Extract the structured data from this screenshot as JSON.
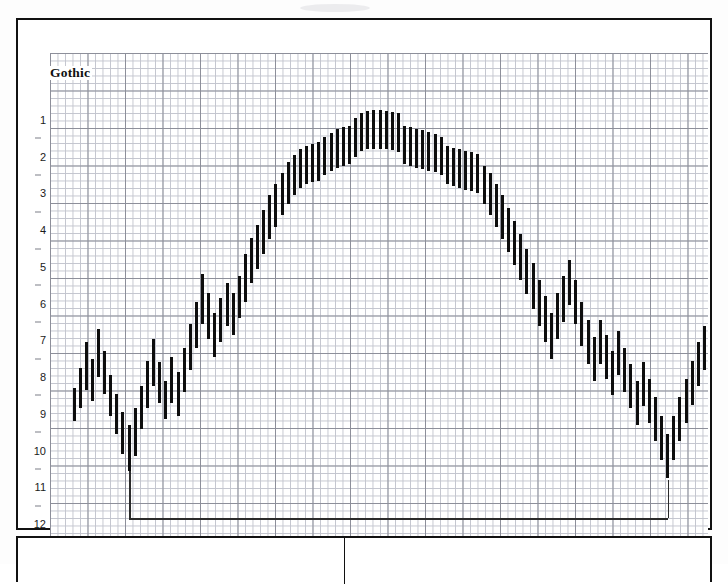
{
  "chart_data": {
    "type": "bar",
    "title": "Gothic",
    "subtitle": "",
    "xlabel": "",
    "ylabel": "",
    "grid": true,
    "legend_position": "none",
    "y_axis_inverted": true,
    "ylim": [
      0.5,
      12.5
    ],
    "y_ticks": [
      1,
      2,
      3,
      4,
      5,
      6,
      7,
      8,
      9,
      10,
      11,
      12
    ],
    "y_tick_labels": [
      "1",
      "2",
      "3",
      "4",
      "5",
      "6",
      "7",
      "8",
      "9",
      "10",
      "11",
      "12"
    ],
    "y_minor_ticks": [
      1.5,
      2.5,
      3.5,
      4.5,
      5.5,
      6.5,
      7.5,
      8.5,
      9.5,
      10.5,
      11.5
    ],
    "bar_orientation": "vertical-range",
    "note": "Each bar is a vertical high-low range segment drawn on graph paper; axis values increase downward.",
    "bars": [
      {
        "i": 0,
        "top": 8.3,
        "bottom": 9.2
      },
      {
        "i": 1,
        "top": 7.75,
        "bottom": 8.85
      },
      {
        "i": 2,
        "top": 7.05,
        "bottom": 8.35
      },
      {
        "i": 3,
        "top": 7.5,
        "bottom": 8.65
      },
      {
        "i": 4,
        "top": 6.7,
        "bottom": 8.0
      },
      {
        "i": 5,
        "top": 7.3,
        "bottom": 8.45
      },
      {
        "i": 6,
        "top": 7.95,
        "bottom": 9.05
      },
      {
        "i": 7,
        "top": 8.45,
        "bottom": 9.55
      },
      {
        "i": 8,
        "top": 8.95,
        "bottom": 10.1
      },
      {
        "i": 9,
        "top": 9.3,
        "bottom": 10.55
      },
      {
        "i": 10,
        "top": 8.85,
        "bottom": 10.15
      },
      {
        "i": 11,
        "top": 8.25,
        "bottom": 9.4
      },
      {
        "i": 12,
        "top": 7.55,
        "bottom": 8.85
      },
      {
        "i": 13,
        "top": 6.95,
        "bottom": 8.25
      },
      {
        "i": 14,
        "top": 7.6,
        "bottom": 8.7
      },
      {
        "i": 15,
        "top": 8.1,
        "bottom": 9.15
      },
      {
        "i": 16,
        "top": 7.45,
        "bottom": 8.7
      },
      {
        "i": 17,
        "top": 7.85,
        "bottom": 9.05
      },
      {
        "i": 18,
        "top": 7.2,
        "bottom": 8.4
      },
      {
        "i": 19,
        "top": 6.55,
        "bottom": 7.8
      },
      {
        "i": 20,
        "top": 5.95,
        "bottom": 7.2
      },
      {
        "i": 21,
        "top": 5.2,
        "bottom": 6.55
      },
      {
        "i": 22,
        "top": 5.7,
        "bottom": 6.95
      },
      {
        "i": 23,
        "top": 6.25,
        "bottom": 7.45
      },
      {
        "i": 24,
        "top": 5.85,
        "bottom": 7.05
      },
      {
        "i": 25,
        "top": 5.45,
        "bottom": 6.6
      },
      {
        "i": 26,
        "top": 5.7,
        "bottom": 6.85
      },
      {
        "i": 27,
        "top": 5.25,
        "bottom": 6.4
      },
      {
        "i": 28,
        "top": 4.65,
        "bottom": 5.95
      },
      {
        "i": 29,
        "top": 4.2,
        "bottom": 5.45
      },
      {
        "i": 30,
        "top": 3.85,
        "bottom": 5.05
      },
      {
        "i": 31,
        "top": 3.45,
        "bottom": 4.65
      },
      {
        "i": 32,
        "top": 3.05,
        "bottom": 4.25
      },
      {
        "i": 33,
        "top": 2.75,
        "bottom": 3.9
      },
      {
        "i": 34,
        "top": 2.45,
        "bottom": 3.6
      },
      {
        "i": 35,
        "top": 2.15,
        "bottom": 3.3
      },
      {
        "i": 36,
        "top": 1.95,
        "bottom": 3.05
      },
      {
        "i": 37,
        "top": 1.8,
        "bottom": 2.85
      },
      {
        "i": 38,
        "top": 1.7,
        "bottom": 2.75
      },
      {
        "i": 39,
        "top": 1.65,
        "bottom": 2.7
      },
      {
        "i": 40,
        "top": 1.6,
        "bottom": 2.65
      },
      {
        "i": 41,
        "top": 1.45,
        "bottom": 2.5
      },
      {
        "i": 42,
        "top": 1.35,
        "bottom": 2.4
      },
      {
        "i": 43,
        "top": 1.25,
        "bottom": 2.3
      },
      {
        "i": 44,
        "top": 1.2,
        "bottom": 2.25
      },
      {
        "i": 45,
        "top": 1.15,
        "bottom": 2.2
      },
      {
        "i": 46,
        "top": 0.95,
        "bottom": 2.0
      },
      {
        "i": 47,
        "top": 0.8,
        "bottom": 1.85
      },
      {
        "i": 48,
        "top": 0.75,
        "bottom": 1.8
      },
      {
        "i": 49,
        "top": 0.72,
        "bottom": 1.78
      },
      {
        "i": 50,
        "top": 0.72,
        "bottom": 1.78
      },
      {
        "i": 51,
        "top": 0.75,
        "bottom": 1.8
      },
      {
        "i": 52,
        "top": 0.78,
        "bottom": 1.82
      },
      {
        "i": 53,
        "top": 0.82,
        "bottom": 1.86
      },
      {
        "i": 54,
        "top": 1.15,
        "bottom": 2.2
      },
      {
        "i": 55,
        "top": 1.2,
        "bottom": 2.25
      },
      {
        "i": 56,
        "top": 1.25,
        "bottom": 2.3
      },
      {
        "i": 57,
        "top": 1.28,
        "bottom": 2.33
      },
      {
        "i": 58,
        "top": 1.32,
        "bottom": 2.38
      },
      {
        "i": 59,
        "top": 1.38,
        "bottom": 2.42
      },
      {
        "i": 60,
        "top": 1.45,
        "bottom": 2.5
      },
      {
        "i": 61,
        "top": 1.7,
        "bottom": 2.75
      },
      {
        "i": 62,
        "top": 1.75,
        "bottom": 2.8
      },
      {
        "i": 63,
        "top": 1.8,
        "bottom": 2.85
      },
      {
        "i": 64,
        "top": 1.85,
        "bottom": 2.9
      },
      {
        "i": 65,
        "top": 1.88,
        "bottom": 2.94
      },
      {
        "i": 66,
        "top": 1.92,
        "bottom": 2.98
      },
      {
        "i": 67,
        "top": 2.25,
        "bottom": 3.3
      },
      {
        "i": 68,
        "top": 2.45,
        "bottom": 3.6
      },
      {
        "i": 69,
        "top": 2.75,
        "bottom": 3.9
      },
      {
        "i": 70,
        "top": 3.05,
        "bottom": 4.25
      },
      {
        "i": 71,
        "top": 3.4,
        "bottom": 4.6
      },
      {
        "i": 72,
        "top": 3.75,
        "bottom": 4.95
      },
      {
        "i": 73,
        "top": 4.1,
        "bottom": 5.35
      },
      {
        "i": 74,
        "top": 4.5,
        "bottom": 5.75
      },
      {
        "i": 75,
        "top": 4.9,
        "bottom": 6.15
      },
      {
        "i": 76,
        "top": 5.35,
        "bottom": 6.6
      },
      {
        "i": 77,
        "top": 5.8,
        "bottom": 7.05
      },
      {
        "i": 78,
        "top": 6.25,
        "bottom": 7.5
      },
      {
        "i": 79,
        "top": 5.7,
        "bottom": 6.95
      },
      {
        "i": 80,
        "top": 5.25,
        "bottom": 6.5
      },
      {
        "i": 81,
        "top": 4.8,
        "bottom": 6.05
      },
      {
        "i": 82,
        "top": 5.35,
        "bottom": 6.55
      },
      {
        "i": 83,
        "top": 5.95,
        "bottom": 7.15
      },
      {
        "i": 84,
        "top": 6.45,
        "bottom": 7.65
      },
      {
        "i": 85,
        "top": 6.9,
        "bottom": 8.1
      },
      {
        "i": 86,
        "top": 6.45,
        "bottom": 7.65
      },
      {
        "i": 87,
        "top": 6.85,
        "bottom": 8.05
      },
      {
        "i": 88,
        "top": 7.3,
        "bottom": 8.5
      },
      {
        "i": 89,
        "top": 6.75,
        "bottom": 7.95
      },
      {
        "i": 90,
        "top": 7.2,
        "bottom": 8.4
      },
      {
        "i": 91,
        "top": 7.65,
        "bottom": 8.85
      },
      {
        "i": 92,
        "top": 8.1,
        "bottom": 9.3
      },
      {
        "i": 93,
        "top": 7.6,
        "bottom": 8.8
      },
      {
        "i": 94,
        "top": 8.05,
        "bottom": 9.25
      },
      {
        "i": 95,
        "top": 8.55,
        "bottom": 9.75
      },
      {
        "i": 96,
        "top": 9.05,
        "bottom": 10.25
      },
      {
        "i": 97,
        "top": 9.55,
        "bottom": 10.75
      },
      {
        "i": 98,
        "top": 9.05,
        "bottom": 10.25
      },
      {
        "i": 99,
        "top": 8.55,
        "bottom": 9.75
      },
      {
        "i": 100,
        "top": 8.05,
        "bottom": 9.25
      },
      {
        "i": 101,
        "top": 7.55,
        "bottom": 8.75
      },
      {
        "i": 102,
        "top": 7.05,
        "bottom": 8.25
      },
      {
        "i": 103,
        "top": 6.6,
        "bottom": 7.8
      },
      {
        "i": 104,
        "top": 7.1,
        "bottom": 8.3
      },
      {
        "i": 105,
        "top": 7.55,
        "bottom": 8.75
      },
      {
        "i": 106,
        "top": 8.0,
        "bottom": 9.2
      }
    ],
    "annotation": {
      "type": "bracket",
      "level": 11.85,
      "start_index": 9,
      "end_index": 97,
      "riser_top_left": 10.55,
      "riser_top_right": 10.8
    }
  },
  "bottom_panel": {
    "left_cell_text": "",
    "right_cell_text": ""
  }
}
